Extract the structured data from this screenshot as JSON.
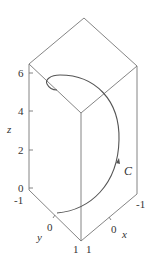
{
  "figure": {
    "type": "3d-parametric-curve",
    "curve_label": "C",
    "axes": {
      "x": {
        "label": "x",
        "ticks": [
          "-1",
          "0",
          "1"
        ]
      },
      "y": {
        "label": "y",
        "ticks": [
          "-1",
          "0",
          "1"
        ]
      },
      "z": {
        "label": "z",
        "ticks": [
          "0",
          "2",
          "4",
          "6"
        ]
      }
    },
    "colors": {
      "edge": "#777777",
      "curve": "#555555",
      "text": "#333333"
    }
  }
}
